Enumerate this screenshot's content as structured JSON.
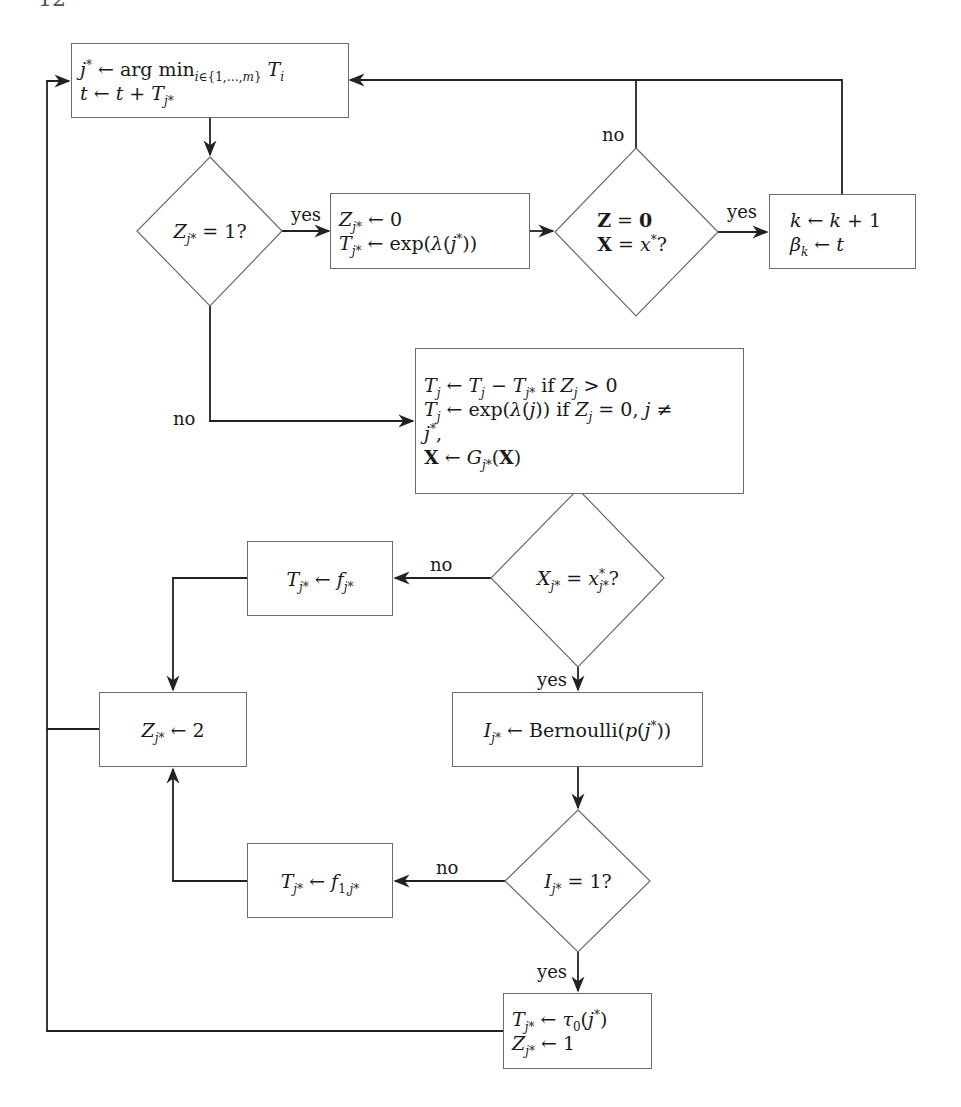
{
  "diagram": {
    "type": "flowchart",
    "colors": {
      "stroke": "#222222",
      "node_border": "#6b6b6b",
      "background": "#ffffff",
      "text": "#1a1a1a"
    },
    "header": {
      "page_number": "12",
      "running_title": ""
    },
    "nodes": {
      "select_event": {
        "lines": [
          "j* ← arg min_{i∈{1,…,m}} T_i",
          "t ← t + T_{j*}"
        ]
      },
      "check_z_equals_1": {
        "label": "Z_{j*} = 1?"
      },
      "reset_z": {
        "lines": [
          "Z_{j*} ← 0",
          "T_{j*} ← exp(λ(j*))"
        ]
      },
      "check_target_state": {
        "lines": [
          "Z = 0",
          "X = x*?"
        ]
      },
      "record_hit": {
        "lines": [
          "k ← k + 1",
          "β_k ← t"
        ]
      },
      "update_all": {
        "lines": [
          "T_j ← T_j − T_{j*} if Z_j > 0",
          "T_j ← exp(λ(j)) if Z_j = 0, j ≠",
          "j*,",
          "X ← G_{j*}(X)"
        ]
      },
      "check_component": {
        "label": "X_{j*} = x*_{j*}?"
      },
      "set_f": {
        "label": "T_{j*} ← f_{j*}"
      },
      "set_z_2": {
        "label": "Z_{j*} ← 2"
      },
      "bernoulli": {
        "label": "I_{j*} ← Bernoulli(p(j*))"
      },
      "check_i": {
        "label": "I_{j*} = 1?"
      },
      "set_f1": {
        "label": "T_{j*} ← f_{1,j*}"
      },
      "set_tau": {
        "lines": [
          "T_{j*} ← τ_0(j*)",
          "Z_{j*} ← 1"
        ]
      }
    },
    "edge_labels": {
      "yes_1": "yes",
      "no_1": "no",
      "no_2": "no",
      "yes_2": "yes",
      "no_3": "no",
      "yes_3": "yes",
      "no_4": "no",
      "yes_4": "yes"
    }
  }
}
